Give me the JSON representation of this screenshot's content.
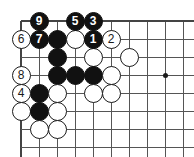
{
  "diagram": {
    "board": {
      "width_px": 194,
      "height_px": 157,
      "grid_spacing_px": 18,
      "origin_x_px": 21,
      "origin_y_px": 21,
      "cols": 10,
      "rows": 8,
      "line_color": "#555555",
      "edge_line_color": "#444444",
      "background_color": "#ffffff",
      "star_points": [
        {
          "col": 8,
          "row": 3
        }
      ]
    },
    "stones": [
      {
        "col": 1,
        "row": 0,
        "color": "black",
        "label": "9"
      },
      {
        "col": 3,
        "row": 0,
        "color": "black",
        "label": "5"
      },
      {
        "col": 4,
        "row": 0,
        "color": "black",
        "label": "3"
      },
      {
        "col": 0,
        "row": 1,
        "color": "white",
        "label": "6"
      },
      {
        "col": 1,
        "row": 1,
        "color": "black",
        "label": "7"
      },
      {
        "col": 2,
        "row": 1,
        "color": "black",
        "label": ""
      },
      {
        "col": 3,
        "row": 1,
        "color": "white",
        "label": ""
      },
      {
        "col": 4,
        "row": 1,
        "color": "black",
        "label": "1"
      },
      {
        "col": 5,
        "row": 1,
        "color": "white",
        "label": "2"
      },
      {
        "col": 2,
        "row": 2,
        "color": "black",
        "label": ""
      },
      {
        "col": 4,
        "row": 2,
        "color": "white",
        "label": ""
      },
      {
        "col": 6,
        "row": 2,
        "color": "white",
        "label": ""
      },
      {
        "col": 0,
        "row": 3,
        "color": "white",
        "label": "8"
      },
      {
        "col": 2,
        "row": 3,
        "color": "black",
        "label": ""
      },
      {
        "col": 3,
        "row": 3,
        "color": "black",
        "label": ""
      },
      {
        "col": 4,
        "row": 3,
        "color": "black",
        "label": ""
      },
      {
        "col": 5,
        "row": 3,
        "color": "white",
        "label": ""
      },
      {
        "col": 0,
        "row": 4,
        "color": "white",
        "label": "4"
      },
      {
        "col": 1,
        "row": 4,
        "color": "black",
        "label": ""
      },
      {
        "col": 2,
        "row": 4,
        "color": "white",
        "label": ""
      },
      {
        "col": 4,
        "row": 4,
        "color": "white",
        "label": ""
      },
      {
        "col": 5,
        "row": 4,
        "color": "white",
        "label": ""
      },
      {
        "col": 0,
        "row": 5,
        "color": "white",
        "label": ""
      },
      {
        "col": 1,
        "row": 5,
        "color": "black",
        "label": ""
      },
      {
        "col": 2,
        "row": 5,
        "color": "white",
        "label": ""
      },
      {
        "col": 1,
        "row": 6,
        "color": "white",
        "label": ""
      },
      {
        "col": 2,
        "row": 6,
        "color": "white",
        "label": ""
      }
    ]
  }
}
